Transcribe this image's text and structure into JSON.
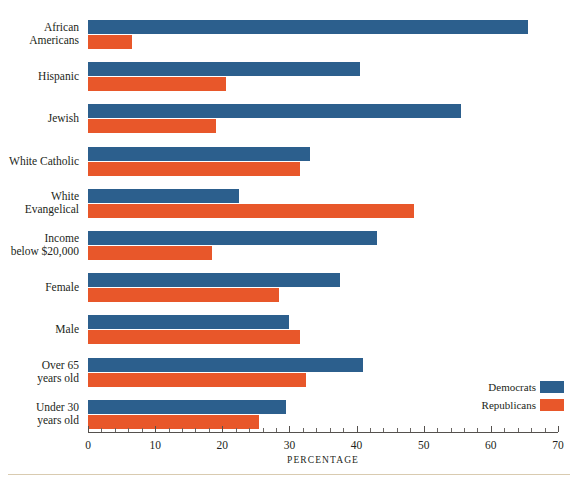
{
  "figure": {
    "title_partial": "",
    "x_axis_title": "PERCENTAGE"
  },
  "legend": {
    "position": "bottom-right",
    "entries": [
      {
        "label": "Democrats",
        "color": "#2c5f8d"
      },
      {
        "label": "Republicans",
        "color": "#e8572a"
      }
    ]
  },
  "axis": {
    "tick_labels": [
      "0",
      "10",
      "20",
      "30",
      "40",
      "50",
      "60",
      "70"
    ]
  },
  "categories": [
    {
      "line1": "African",
      "line2": "Americans"
    },
    {
      "line1": "Hispanic",
      "line2": ""
    },
    {
      "line1": "Jewish",
      "line2": ""
    },
    {
      "line1": "White Catholic",
      "line2": ""
    },
    {
      "line1": "White",
      "line2": "Evangelical"
    },
    {
      "line1": "Income",
      "line2": "below $20,000"
    },
    {
      "line1": "Female",
      "line2": ""
    },
    {
      "line1": "Male",
      "line2": ""
    },
    {
      "line1": "Over 65",
      "line2": "years old"
    },
    {
      "line1": "Under 30",
      "line2": "years old"
    }
  ],
  "chart_data": {
    "type": "bar",
    "orientation": "horizontal",
    "title": "",
    "xlabel": "PERCENTAGE",
    "ylabel": "",
    "xlim": [
      0,
      70
    ],
    "xticks": [
      0,
      10,
      20,
      30,
      40,
      50,
      60,
      70
    ],
    "minor_tick_interval": 2,
    "grid": false,
    "legend_position": "bottom-right",
    "categories": [
      "African Americans",
      "Hispanic",
      "Jewish",
      "White Catholic",
      "White Evangelical",
      "Income below $20,000",
      "Female",
      "Male",
      "Over 65 years old",
      "Under 30 years old"
    ],
    "series": [
      {
        "name": "Democrats",
        "color": "#2c5f8d",
        "values": [
          65.5,
          40.5,
          55.5,
          33,
          22.5,
          43,
          37.5,
          30,
          41,
          29.5
        ]
      },
      {
        "name": "Republicans",
        "color": "#e8572a",
        "values": [
          6.5,
          20.5,
          19,
          31.5,
          48.5,
          18.5,
          28.5,
          31.5,
          32.5,
          25.5
        ]
      }
    ]
  }
}
